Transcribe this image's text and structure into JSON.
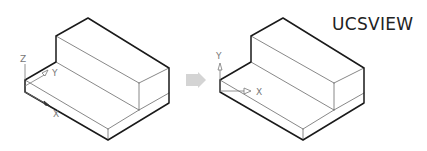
{
  "title": "UCSVIEW",
  "before": {
    "axes": {
      "z_label": "Z",
      "y_label": "Y",
      "x_label": "X"
    }
  },
  "after": {
    "axes": {
      "y_label": "Y",
      "x_label": "X"
    }
  },
  "arrow": {
    "name": "transition-arrow",
    "color": "#d0d0d0"
  },
  "colors": {
    "edge_outer": "#1a1a1a",
    "edge_inner": "#6a6a6a",
    "axis": "#777777"
  }
}
